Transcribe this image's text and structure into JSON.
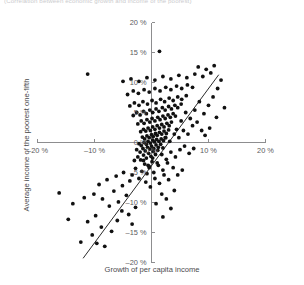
{
  "caption": {
    "top_truncated": "(Correlation between economic growth and income of the poorest)"
  },
  "chart_data": {
    "type": "scatter",
    "title": "",
    "xlabel": "Growth of per capita income",
    "ylabel": "Average income of the poorest one-fifth",
    "xlim": [
      -20,
      20
    ],
    "ylim": [
      -20,
      20
    ],
    "xticks": [
      -20,
      -10,
      0,
      10,
      20
    ],
    "yticks": [
      -20,
      -15,
      -10,
      -5,
      0,
      5,
      10,
      15,
      20
    ],
    "xticklabels": [
      "–20 %",
      "–10 %",
      "0 %",
      "10 %",
      "20 %"
    ],
    "yticklabels": [
      "–20 %",
      "–15 %",
      "–10 %",
      "–5 %",
      "0 %",
      "5 %",
      "10 %",
      "15 %",
      "20 %"
    ],
    "grid": false,
    "legend": "none",
    "axis_style": "centered-cross",
    "marker": {
      "shape": "circle",
      "color": "#111111",
      "size": 1.9
    },
    "trendline": {
      "type": "linear-fit",
      "color": "#2b2b2b",
      "x_start": -12.0,
      "y_start": -19.3,
      "x_end": 11.8,
      "y_end": 11.3
    },
    "point_count": 228,
    "points": [
      [
        -12.4,
        -16.6
      ],
      [
        -11.2,
        -13.2
      ],
      [
        -10.4,
        -15.4
      ],
      [
        -9.6,
        -16.8
      ],
      [
        -8.8,
        -14.1
      ],
      [
        -8.2,
        -17.3
      ],
      [
        -13.8,
        -10.2
      ],
      [
        -10.1,
        -8.6
      ],
      [
        -8.6,
        -9.4
      ],
      [
        -7.4,
        -10.6
      ],
      [
        -6.6,
        -8.1
      ],
      [
        -5.8,
        -9.9
      ],
      [
        -5.1,
        -7.2
      ],
      [
        -4.4,
        -8.8
      ],
      [
        -3.8,
        -6.4
      ],
      [
        -6.2,
        -5.6
      ],
      [
        -4.9,
        -5.0
      ],
      [
        -3.4,
        -5.4
      ],
      [
        -2.8,
        -4.3
      ],
      [
        -2.2,
        -6.0
      ],
      [
        -1.7,
        -4.8
      ],
      [
        -1.2,
        -3.6
      ],
      [
        -0.8,
        -5.2
      ],
      [
        -0.4,
        -4.0
      ],
      [
        0.1,
        -3.2
      ],
      [
        -3.0,
        -3.0
      ],
      [
        -2.4,
        -2.4
      ],
      [
        -1.9,
        -2.9
      ],
      [
        -1.4,
        -2.1
      ],
      [
        -0.9,
        -2.6
      ],
      [
        -0.5,
        -1.8
      ],
      [
        -0.1,
        -2.3
      ],
      [
        0.3,
        -1.5
      ],
      [
        0.7,
        -2.0
      ],
      [
        1.1,
        -1.3
      ],
      [
        -2.6,
        -1.2
      ],
      [
        -2.0,
        -1.6
      ],
      [
        -1.5,
        -1.0
      ],
      [
        -1.1,
        -1.4
      ],
      [
        -0.7,
        -0.8
      ],
      [
        -0.3,
        -1.1
      ],
      [
        0.0,
        -0.6
      ],
      [
        0.4,
        -1.0
      ],
      [
        0.8,
        -0.4
      ],
      [
        1.2,
        -0.8
      ],
      [
        1.6,
        -0.3
      ],
      [
        2.0,
        -0.9
      ],
      [
        -2.2,
        -0.2
      ],
      [
        -1.8,
        -0.5
      ],
      [
        -1.3,
        0.0
      ],
      [
        -0.9,
        -0.3
      ],
      [
        -0.6,
        0.2
      ],
      [
        -0.2,
        -0.1
      ],
      [
        0.2,
        0.4
      ],
      [
        0.5,
        0.1
      ],
      [
        0.9,
        0.5
      ],
      [
        1.3,
        0.2
      ],
      [
        1.7,
        0.6
      ],
      [
        2.1,
        0.3
      ],
      [
        2.5,
        0.8
      ],
      [
        -1.6,
        0.9
      ],
      [
        -1.2,
        0.6
      ],
      [
        -0.8,
        1.1
      ],
      [
        -0.4,
        0.8
      ],
      [
        0.0,
        1.3
      ],
      [
        0.3,
        1.0
      ],
      [
        0.7,
        1.5
      ],
      [
        1.0,
        1.2
      ],
      [
        1.4,
        1.7
      ],
      [
        1.8,
        1.4
      ],
      [
        2.2,
        1.9
      ],
      [
        2.6,
        1.5
      ],
      [
        3.0,
        2.1
      ],
      [
        -1.9,
        1.8
      ],
      [
        -1.4,
        2.2
      ],
      [
        -1.0,
        1.9
      ],
      [
        -0.6,
        2.4
      ],
      [
        -0.2,
        2.0
      ],
      [
        0.2,
        2.6
      ],
      [
        0.6,
        2.2
      ],
      [
        1.0,
        2.8
      ],
      [
        1.4,
        2.4
      ],
      [
        1.8,
        3.0
      ],
      [
        2.2,
        2.6
      ],
      [
        2.7,
        3.2
      ],
      [
        3.1,
        2.8
      ],
      [
        3.5,
        3.4
      ],
      [
        -2.4,
        3.1
      ],
      [
        -1.8,
        3.6
      ],
      [
        -1.3,
        3.2
      ],
      [
        -0.8,
        3.8
      ],
      [
        -0.3,
        3.4
      ],
      [
        0.1,
        4.0
      ],
      [
        0.6,
        3.6
      ],
      [
        1.1,
        4.2
      ],
      [
        1.5,
        3.8
      ],
      [
        2.0,
        4.4
      ],
      [
        2.4,
        4.0
      ],
      [
        2.9,
        4.6
      ],
      [
        3.3,
        4.2
      ],
      [
        3.8,
        4.8
      ],
      [
        4.2,
        4.4
      ],
      [
        -3.2,
        4.5
      ],
      [
        -2.6,
        5.0
      ],
      [
        -2.0,
        4.6
      ],
      [
        -1.4,
        5.2
      ],
      [
        -0.9,
        4.8
      ],
      [
        -0.3,
        5.4
      ],
      [
        0.2,
        5.0
      ],
      [
        0.8,
        5.6
      ],
      [
        1.3,
        5.2
      ],
      [
        1.9,
        5.8
      ],
      [
        2.4,
        5.4
      ],
      [
        3.0,
        6.0
      ],
      [
        3.5,
        5.6
      ],
      [
        4.1,
        6.2
      ],
      [
        4.6,
        5.8
      ],
      [
        5.2,
        6.4
      ],
      [
        -3.8,
        6.1
      ],
      [
        -3.0,
        6.6
      ],
      [
        -2.2,
        6.2
      ],
      [
        -1.5,
        6.8
      ],
      [
        -0.7,
        6.4
      ],
      [
        0.1,
        7.0
      ],
      [
        0.8,
        6.6
      ],
      [
        1.6,
        7.2
      ],
      [
        2.3,
        6.8
      ],
      [
        3.1,
        7.4
      ],
      [
        3.8,
        7.0
      ],
      [
        4.6,
        7.6
      ],
      [
        5.3,
        7.2
      ],
      [
        6.1,
        7.8
      ],
      [
        -4.2,
        8.0
      ],
      [
        -3.2,
        8.6
      ],
      [
        -2.3,
        8.2
      ],
      [
        -1.3,
        8.8
      ],
      [
        -0.4,
        8.4
      ],
      [
        0.6,
        9.0
      ],
      [
        1.5,
        8.6
      ],
      [
        2.5,
        9.2
      ],
      [
        3.4,
        8.8
      ],
      [
        4.4,
        9.4
      ],
      [
        5.3,
        9.0
      ],
      [
        6.3,
        9.6
      ],
      [
        7.2,
        9.2
      ],
      [
        -5.0,
        10.2
      ],
      [
        -3.6,
        10.6
      ],
      [
        -2.2,
        10.2
      ],
      [
        -0.8,
        10.8
      ],
      [
        0.6,
        10.4
      ],
      [
        2.0,
        11.0
      ],
      [
        3.4,
        10.6
      ],
      [
        4.8,
        11.2
      ],
      [
        6.2,
        10.8
      ],
      [
        7.6,
        11.4
      ],
      [
        9.0,
        11.0
      ],
      [
        10.4,
        11.6
      ],
      [
        -11.2,
        11.4
      ],
      [
        1.4,
        15.2
      ],
      [
        8.2,
        12.6
      ],
      [
        9.6,
        12.2
      ],
      [
        11.0,
        12.8
      ],
      [
        12.2,
        10.4
      ],
      [
        11.6,
        9.0
      ],
      [
        10.8,
        7.6
      ],
      [
        10.0,
        6.2
      ],
      [
        9.2,
        4.8
      ],
      [
        8.4,
        6.8
      ],
      [
        7.6,
        5.4
      ],
      [
        6.8,
        4.0
      ],
      [
        6.0,
        5.0
      ],
      [
        5.2,
        3.6
      ],
      [
        4.4,
        2.2
      ],
      [
        7.2,
        2.8
      ],
      [
        8.0,
        3.4
      ],
      [
        8.8,
        2.0
      ],
      [
        6.4,
        1.4
      ],
      [
        5.6,
        2.0
      ],
      [
        4.8,
        0.8
      ],
      [
        4.0,
        1.4
      ],
      [
        3.2,
        0.2
      ],
      [
        2.4,
        0.8
      ],
      [
        9.4,
        1.2
      ],
      [
        10.2,
        2.4
      ],
      [
        11.4,
        4.2
      ],
      [
        12.8,
        5.8
      ],
      [
        5.0,
        -1.2
      ],
      [
        5.8,
        -0.6
      ],
      [
        6.6,
        -1.8
      ],
      [
        7.4,
        -1.0
      ],
      [
        4.2,
        -2.4
      ],
      [
        3.4,
        -1.6
      ],
      [
        2.6,
        -2.8
      ],
      [
        1.8,
        -2.0
      ],
      [
        1.0,
        -3.4
      ],
      [
        0.2,
        -2.6
      ],
      [
        -0.6,
        -3.8
      ],
      [
        -1.4,
        -3.0
      ],
      [
        3.8,
        -4.2
      ],
      [
        2.8,
        -3.4
      ],
      [
        2.0,
        -4.6
      ],
      [
        1.2,
        -3.8
      ],
      [
        0.4,
        -5.0
      ],
      [
        -0.4,
        -4.2
      ],
      [
        4.6,
        -5.4
      ],
      [
        5.4,
        -4.6
      ],
      [
        3.0,
        -6.2
      ],
      [
        2.2,
        -5.4
      ],
      [
        1.4,
        -6.8
      ],
      [
        0.6,
        -6.0
      ],
      [
        -0.2,
        -7.4
      ],
      [
        -1.0,
        -6.6
      ],
      [
        4.0,
        -8.0
      ],
      [
        2.6,
        -9.4
      ],
      [
        1.8,
        -8.6
      ],
      [
        0.8,
        -10.2
      ],
      [
        3.4,
        -11.0
      ],
      [
        2.0,
        -12.4
      ],
      [
        -2.8,
        -10.8
      ],
      [
        -4.0,
        -12.0
      ],
      [
        -5.2,
        -11.4
      ],
      [
        -3.4,
        -13.6
      ],
      [
        -16.2,
        -8.4
      ],
      [
        -14.6,
        -12.8
      ],
      [
        -7.8,
        -6.2
      ],
      [
        -9.2,
        -7.0
      ],
      [
        -11.8,
        -9.2
      ],
      [
        -6.0,
        -13.0
      ],
      [
        -7.0,
        -14.8
      ],
      [
        -9.8,
        -12.2
      ]
    ]
  }
}
